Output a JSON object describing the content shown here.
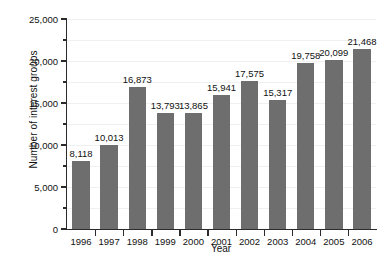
{
  "chart_data": {
    "type": "bar",
    "title": "",
    "xlabel": "Year",
    "ylabel": "Number of interest groups",
    "categories": [
      "1996",
      "1997",
      "1998",
      "1999",
      "2000",
      "2001",
      "2002",
      "2003",
      "2004",
      "2005",
      "2006"
    ],
    "values": [
      8118,
      10013,
      16873,
      13793,
      13865,
      15941,
      17575,
      15317,
      19758,
      20099,
      21468
    ],
    "value_labels": [
      "8,118",
      "10,013",
      "16,873",
      "13,793",
      "13,865",
      "15,941",
      "17,575",
      "15,317",
      "19,758",
      "20,099",
      "21,468"
    ],
    "ylim": [
      0,
      25000
    ],
    "y_major_ticks": [
      0,
      5000,
      10000,
      15000,
      20000,
      25000
    ],
    "y_major_tick_labels": [
      "0",
      "5,000",
      "10,000",
      "15,000",
      "20,000",
      "25,000"
    ],
    "y_minor_ticks": [
      2500,
      7500,
      12500,
      17500,
      22500
    ],
    "grid": "horizontal-faint",
    "legend": "none",
    "bar_color": "#6e6e6e",
    "axis_color": "#2b2b2b",
    "grid_color": "#f0f0f0",
    "background_color": "#ffffff"
  }
}
